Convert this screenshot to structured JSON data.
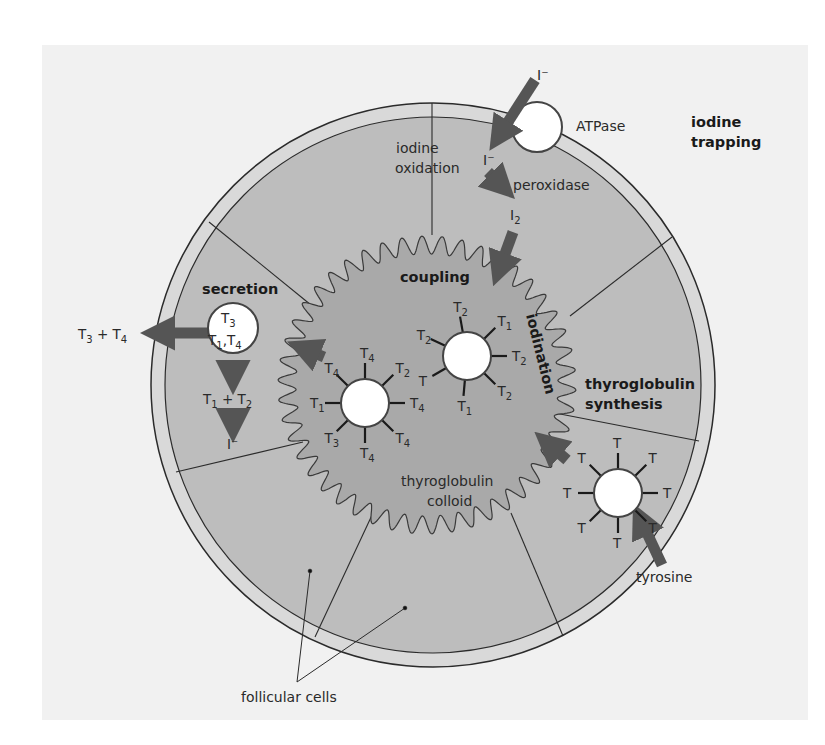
{
  "colors": {
    "page_bg": "#ffffff",
    "panel_bg": "#f1f1f1",
    "membrane": "#d9d9d9",
    "cell_fill": "#bdbdbd",
    "colloid_fill": "#a9a9a9",
    "arrow": "#555555",
    "line": "#2b2b2b",
    "molecule": "#ffffff"
  },
  "labels": {
    "iodine_trapping_1": "iodine",
    "iodine_trapping_2": "trapping",
    "atpase": "ATPase",
    "iodide_outside": "I⁻",
    "iodide_inside": "I⁻",
    "iodine_oxidation_1": "iodine",
    "iodine_oxidation_2": "oxidation",
    "peroxidase": "peroxidase",
    "iodine_I": "I",
    "iodine_sub": "2",
    "coupling": "coupling",
    "iodination": "iodination",
    "secretion": "secretion",
    "thyroglobulin_synthesis_1": "thyroglobulin",
    "thyroglobulin_synthesis_2": "synthesis",
    "colloid_1": "thyroglobulin",
    "colloid_2": "colloid",
    "tyrosine": "tyrosine",
    "follicular_cells": "follicular cells",
    "secreted_products": {
      "a": "T",
      "a_sub": "3",
      "plus": " + ",
      "b": "T",
      "b_sub": "4"
    },
    "recycled_products": {
      "a": "T",
      "a_sub": "1",
      "plus": " + ",
      "b": "T",
      "b_sub": "2"
    },
    "recycled_iodide": "I⁻",
    "vesicle": {
      "line1": "T",
      "line1_sub": "3",
      "line2a": "T",
      "line2a_sub": "1",
      "comma": ",",
      "line2b": "T",
      "line2b_sub": "4"
    }
  },
  "molecules": {
    "synthesis": {
      "labels": [
        "T",
        "T",
        "T",
        "T",
        "T",
        "T",
        "T",
        "T"
      ]
    },
    "coupling": {
      "labels": [
        {
          "t": "T",
          "s": "2"
        },
        {
          "t": "T",
          "s": "1"
        },
        {
          "t": "T",
          "s": "2"
        },
        {
          "t": "T",
          "s": "2"
        },
        {
          "t": "T",
          "s": "1"
        },
        {
          "t": "T",
          "s": ""
        },
        {
          "t": "T",
          "s": "2"
        }
      ]
    },
    "coupled": {
      "labels": [
        {
          "t": "T",
          "s": "4"
        },
        {
          "t": "T",
          "s": "2"
        },
        {
          "t": "T",
          "s": "4"
        },
        {
          "t": "T",
          "s": "4"
        },
        {
          "t": "T",
          "s": "4"
        },
        {
          "t": "T",
          "s": "3"
        },
        {
          "t": "T",
          "s": "1"
        },
        {
          "t": "T",
          "s": "4"
        }
      ]
    }
  }
}
